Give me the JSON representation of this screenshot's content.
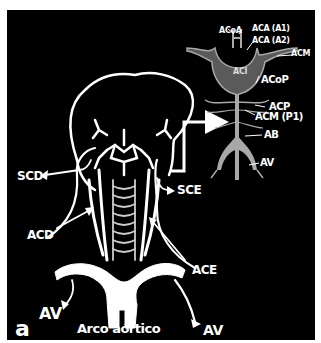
{
  "figure": {
    "panel_letter": "a",
    "colors": {
      "background": "#000000",
      "vessels": "#ffffff",
      "inset_vessels": "#a8a8a8",
      "page": "#ffffff"
    },
    "main_labels": {
      "scd": "SCD",
      "sce": "SCE",
      "acd": "ACD",
      "ace": "ACE",
      "av_left": "AV",
      "av_right": "AV",
      "aortic_arch": "Arco aórtico"
    },
    "inset_labels": {
      "acoa": "ACoA",
      "aca_a1": "ACA (A1)",
      "aca_a2": "ACA (A2)",
      "acm": "ACM",
      "aci": "ACI",
      "acop": "ACoP",
      "acp": "ACP",
      "acm_p1": "ACM (P1)",
      "ab": "AB",
      "av": "AV"
    }
  }
}
